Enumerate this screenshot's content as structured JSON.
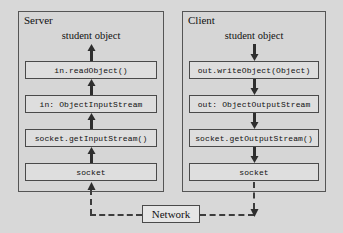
{
  "diagram": {
    "background_color": "#d8d8d8",
    "panel_color": "#d6d6d6",
    "box_color": "#dedede",
    "line_color": "#4a4a4a"
  },
  "server": {
    "title": "Server",
    "caption": "student object",
    "flow_direction": "up",
    "boxes": [
      {
        "label": "in.readObject()"
      },
      {
        "label": "in: ObjectInputStream"
      },
      {
        "label": "socket.getInputStream()"
      },
      {
        "label": "socket"
      }
    ]
  },
  "client": {
    "title": "Client",
    "caption": "student object",
    "flow_direction": "down",
    "boxes": [
      {
        "label": "out.writeObject(Object)"
      },
      {
        "label": "out: ObjectOutputStream"
      },
      {
        "label": "socket.getOutputStream()"
      },
      {
        "label": "socket"
      }
    ]
  },
  "network": {
    "label": "Network",
    "link_style": "dashed"
  }
}
